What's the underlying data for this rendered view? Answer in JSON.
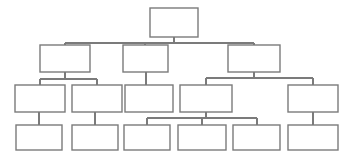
{
  "diagram": {
    "title": "",
    "type": "organizational-chart",
    "background_color": "#ffffff",
    "node_fill_color": "#ffffff",
    "node_border_color": "#7b7b7b",
    "connector_color": "#7b7b7b",
    "level_count": 4,
    "node_count": 15,
    "levels": [
      {
        "index": 1,
        "node_count": 1
      },
      {
        "index": 2,
        "node_count": 3
      },
      {
        "index": 3,
        "node_count": 5
      },
      {
        "index": 4,
        "node_count": 6
      }
    ],
    "nodes": [
      {
        "id": "n1",
        "label": "",
        "level": 1,
        "x": 150,
        "y": 8,
        "w": 48,
        "h": 29
      },
      {
        "id": "n2_1",
        "label": "",
        "level": 2,
        "x": 40,
        "y": 45,
        "w": 50,
        "h": 27
      },
      {
        "id": "n2_2",
        "label": "",
        "level": 2,
        "x": 123,
        "y": 45,
        "w": 45,
        "h": 27
      },
      {
        "id": "n2_3",
        "label": "",
        "level": 2,
        "x": 228,
        "y": 45,
        "w": 52,
        "h": 27
      },
      {
        "id": "n3_1",
        "label": "",
        "level": 3,
        "x": 15,
        "y": 85,
        "w": 50,
        "h": 27
      },
      {
        "id": "n3_2",
        "label": "",
        "level": 3,
        "x": 72,
        "y": 85,
        "w": 50,
        "h": 27
      },
      {
        "id": "n3_3",
        "label": "",
        "level": 3,
        "x": 125,
        "y": 85,
        "w": 48,
        "h": 27
      },
      {
        "id": "n3_4",
        "label": "",
        "level": 3,
        "x": 180,
        "y": 85,
        "w": 52,
        "h": 27
      },
      {
        "id": "n3_5",
        "label": "",
        "level": 3,
        "x": 288,
        "y": 85,
        "w": 50,
        "h": 27
      },
      {
        "id": "n4_1",
        "label": "",
        "level": 4,
        "x": 16,
        "y": 125,
        "w": 46,
        "h": 25
      },
      {
        "id": "n4_2",
        "label": "",
        "level": 4,
        "x": 72,
        "y": 125,
        "w": 46,
        "h": 25
      },
      {
        "id": "n4_3",
        "label": "",
        "level": 4,
        "x": 124,
        "y": 125,
        "w": 46,
        "h": 25
      },
      {
        "id": "n4_4",
        "label": "",
        "level": 4,
        "x": 178,
        "y": 125,
        "w": 48,
        "h": 25
      },
      {
        "id": "n4_5",
        "label": "",
        "level": 4,
        "x": 233,
        "y": 125,
        "w": 47,
        "h": 25
      },
      {
        "id": "n4_6",
        "label": "",
        "level": 4,
        "x": 288,
        "y": 125,
        "w": 50,
        "h": 25
      }
    ],
    "edges": [
      {
        "from": "n1",
        "to": "n2_1"
      },
      {
        "from": "n1",
        "to": "n2_2"
      },
      {
        "from": "n1",
        "to": "n2_3"
      },
      {
        "from": "n2_1",
        "to": "n3_1"
      },
      {
        "from": "n2_1",
        "to": "n3_2"
      },
      {
        "from": "n2_2",
        "to": "n3_3"
      },
      {
        "from": "n2_3",
        "to": "n3_4"
      },
      {
        "from": "n2_3",
        "to": "n3_5"
      },
      {
        "from": "n3_1",
        "to": "n4_1"
      },
      {
        "from": "n3_2",
        "to": "n4_2"
      },
      {
        "from": "n3_4",
        "to": "n4_3"
      },
      {
        "from": "n3_4",
        "to": "n4_4"
      },
      {
        "from": "n3_4",
        "to": "n4_5"
      },
      {
        "from": "n3_5",
        "to": "n4_6"
      }
    ],
    "bus_lines": [
      {
        "id": "bus-root",
        "y": 43,
        "x1": 65,
        "x2": 254
      },
      {
        "id": "bus-l2-a",
        "y": 79,
        "x1": 40,
        "x2": 97
      },
      {
        "id": "bus-l2-c",
        "y": 78,
        "x1": 205,
        "x2": 313
      },
      {
        "id": "bus-l3-d",
        "y": 118,
        "x1": 147,
        "x2": 257
      }
    ]
  }
}
